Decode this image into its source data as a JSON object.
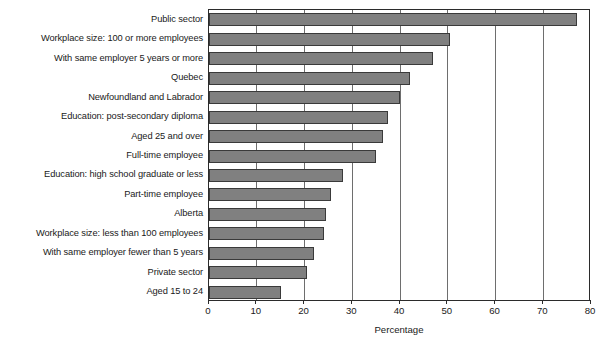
{
  "chart_data": {
    "type": "bar",
    "orientation": "horizontal",
    "title": "",
    "subtitle": "",
    "xlabel": "Percentage",
    "ylabel": "",
    "xlim": [
      0,
      80
    ],
    "xticks": [
      0,
      10,
      20,
      30,
      40,
      50,
      60,
      70,
      80
    ],
    "xtick_labels": [
      "0",
      "10",
      "20",
      "30",
      "40",
      "50",
      "60",
      "70",
      "80"
    ],
    "grid": "vertical",
    "legend": null,
    "categories": [
      "Public sector",
      "Workplace size: 100 or more employees",
      "With same employer 5 years or more",
      "Quebec",
      "Newfoundland and Labrador",
      "Education: post-secondary diploma",
      "Aged 25 and over",
      "Full-time employee",
      "Education: high school graduate or less",
      "Part-time employee",
      "Alberta",
      "Workplace size: less than 100 employees",
      "With same employer fewer than 5 years",
      "Private sector",
      "Aged 15 to 24"
    ],
    "values": [
      77,
      50.5,
      47,
      42,
      40,
      37.5,
      36.5,
      35,
      28,
      25.5,
      24.5,
      24,
      22,
      20.5,
      15
    ],
    "colors": {
      "bar_fill": "#808080",
      "bar_edge": "#3a3a3a",
      "gridline": "#6e6e6e",
      "axis": "#2b2b2b",
      "text": "#1a1a1a",
      "background": "#ffffff"
    }
  }
}
